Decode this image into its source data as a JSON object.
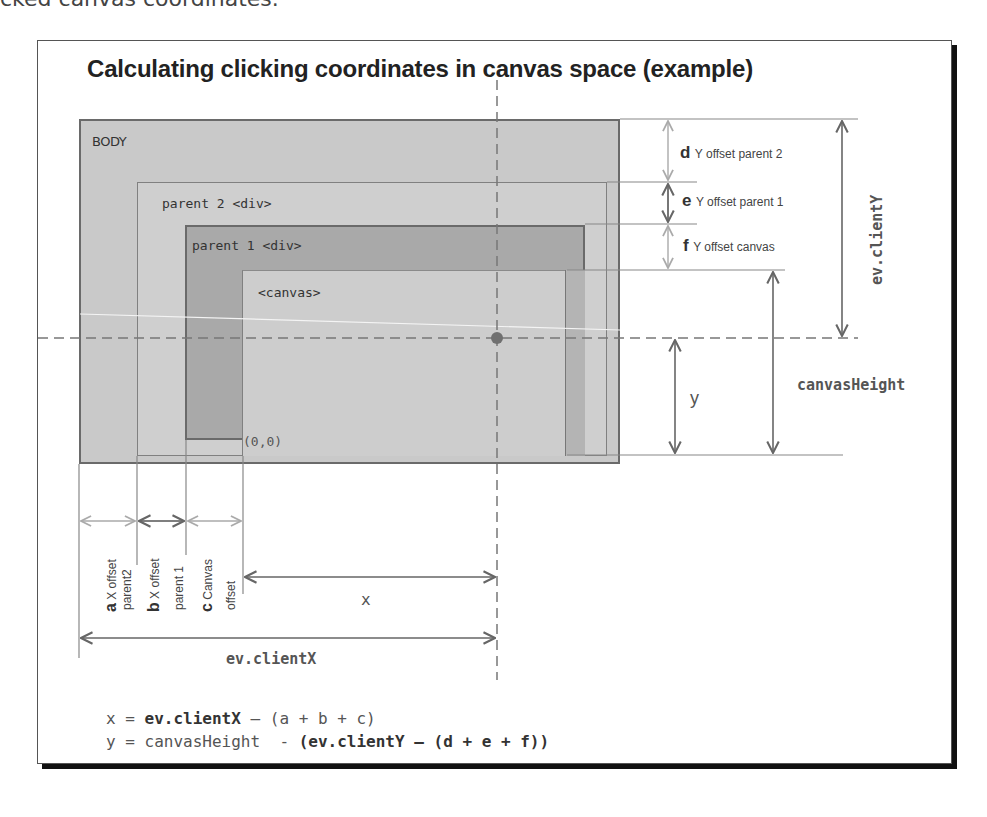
{
  "caption_fragment": "cked canvas coordinates.",
  "title": "Calculating clicking coordinates in canvas space (example)",
  "boxes": {
    "body": "BODY",
    "parent2": "parent 2 <div>",
    "parent1": "parent 1 <div>",
    "canvas": "<canvas>",
    "origin": "(0,0)"
  },
  "y_offsets": [
    {
      "letter": "d",
      "label": "Y offset parent 2"
    },
    {
      "letter": "e",
      "label": "Y offset parent 1"
    },
    {
      "letter": "f",
      "label": "Y offset canvas"
    }
  ],
  "x_offsets": [
    {
      "letter": "a",
      "label_line1": "X offset",
      "label_line2": "parent2"
    },
    {
      "letter": "b",
      "label_line1": "X offset",
      "label_line2": "parent 1"
    },
    {
      "letter": "c",
      "label_line1": "Canvas",
      "label_line2": "offset"
    }
  ],
  "measures": {
    "clientY": "ev.clientY",
    "canvasHeight": "canvasHeight",
    "y": "y",
    "x": "x",
    "clientX": "ev.clientX"
  },
  "formulas": {
    "x": {
      "lhs": "x = ",
      "bold": "ev.clientX",
      "rest": " – (a + b + c)"
    },
    "y": {
      "lhs": "y = ",
      "mid": "canvasHeight  - ",
      "bold": "(ev.clientY – (d + e + f))"
    }
  },
  "colors": {
    "body_fill": "#c9c9c9",
    "parent2_fill": "#cfcfcf",
    "parent1_fill": "#a9a9a9",
    "canvas_fill": "#cdcdcd",
    "line": "#666666",
    "click_point": "#707070"
  }
}
